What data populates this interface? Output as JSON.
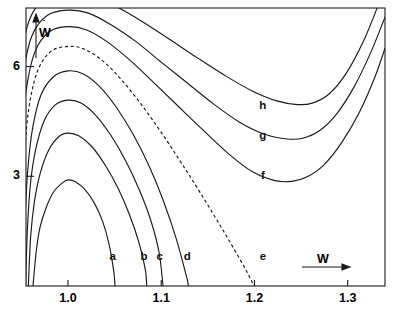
{
  "figure": {
    "background_color": "#ffffff",
    "ink_color": "#1a1a1a"
  },
  "axes": {
    "x_title": "W",
    "y_title": "W",
    "y_title_has_overdot": true,
    "y_title_dot": "˙",
    "x_ticks": [
      {
        "label": "1.0",
        "value": 1.0
      },
      {
        "label": "1.1",
        "value": 1.1
      },
      {
        "label": "1.2",
        "value": 1.2
      },
      {
        "label": "1.3",
        "value": 1.3
      }
    ],
    "y_ticks": [
      {
        "label": "3",
        "value": 3
      },
      {
        "label": "6",
        "value": 6
      }
    ],
    "x_range": [
      0.955,
      1.34
    ],
    "y_range": [
      0.0,
      7.6
    ],
    "grid": false
  },
  "curve_labels": {
    "a": "a",
    "b": "b",
    "c": "c",
    "d": "d",
    "e": "e",
    "f": "f",
    "g": "g",
    "h": "h"
  },
  "chart_data": {
    "type": "line",
    "title": "",
    "xlabel": "W",
    "ylabel": "W-dot",
    "xlim": [
      0.955,
      1.34
    ],
    "ylim": [
      0.0,
      7.6
    ],
    "grid": false,
    "legend": "inline-curve-labels",
    "xticks": [
      1.0,
      1.1,
      1.2,
      1.3
    ],
    "yticks": [
      3,
      6
    ],
    "series": [
      {
        "name": "a",
        "style": "solid",
        "label_position": {
          "x": 1.048,
          "y": 0.72
        },
        "points": [
          [
            0.9625,
            0.0
          ],
          [
            0.966,
            0.95
          ],
          [
            0.97,
            1.6
          ],
          [
            0.976,
            2.1
          ],
          [
            0.984,
            2.55
          ],
          [
            0.994,
            2.82
          ],
          [
            1.0,
            2.9
          ],
          [
            1.008,
            2.85
          ],
          [
            1.018,
            2.64
          ],
          [
            1.028,
            2.28
          ],
          [
            1.037,
            1.78
          ],
          [
            1.044,
            1.15
          ],
          [
            1.049,
            0.42
          ],
          [
            1.0505,
            0.0
          ]
        ]
      },
      {
        "name": "b",
        "style": "solid",
        "label_position": {
          "x": 1.0815,
          "y": 0.72
        },
        "points": [
          [
            0.9575,
            0.0
          ],
          [
            0.96,
            1.35
          ],
          [
            0.964,
            2.3
          ],
          [
            0.97,
            3.06
          ],
          [
            0.979,
            3.7
          ],
          [
            0.99,
            4.08
          ],
          [
            1.0,
            4.18
          ],
          [
            1.012,
            4.1
          ],
          [
            1.026,
            3.8
          ],
          [
            1.04,
            3.3
          ],
          [
            1.054,
            2.66
          ],
          [
            1.066,
            1.95
          ],
          [
            1.076,
            1.2
          ],
          [
            1.083,
            0.45
          ],
          [
            1.0845,
            0.0
          ]
        ]
      },
      {
        "name": "c",
        "style": "solid",
        "label_position": {
          "x": 1.0985,
          "y": 0.72
        },
        "points": [
          [
            0.9545,
            0.0
          ],
          [
            0.9565,
            1.55
          ],
          [
            0.96,
            2.85
          ],
          [
            0.9655,
            3.75
          ],
          [
            0.9745,
            4.52
          ],
          [
            0.9865,
            4.95
          ],
          [
            1.0,
            5.08
          ],
          [
            1.014,
            5.0
          ],
          [
            1.03,
            4.66
          ],
          [
            1.046,
            4.12
          ],
          [
            1.062,
            3.42
          ],
          [
            1.076,
            2.66
          ],
          [
            1.088,
            1.86
          ],
          [
            1.0975,
            0.95
          ],
          [
            1.102,
            0.0
          ]
        ]
      },
      {
        "name": "d",
        "style": "solid",
        "label_position": {
          "x": 1.128,
          "y": 0.72
        },
        "points": [
          [
            0.952,
            0.0
          ],
          [
            0.954,
            1.85
          ],
          [
            0.957,
            3.2
          ],
          [
            0.962,
            4.3
          ],
          [
            0.971,
            5.22
          ],
          [
            0.9845,
            5.72
          ],
          [
            1.0,
            5.88
          ],
          [
            1.016,
            5.8
          ],
          [
            1.034,
            5.45
          ],
          [
            1.052,
            4.88
          ],
          [
            1.07,
            4.14
          ],
          [
            1.087,
            3.28
          ],
          [
            1.102,
            2.35
          ],
          [
            1.116,
            1.3
          ],
          [
            1.1275,
            0.22
          ],
          [
            1.129,
            0.0
          ]
        ]
      },
      {
        "name": "e",
        "style": "dashed",
        "label_position": {
          "x": 1.209,
          "y": 0.72
        },
        "points": [
          [
            0.9495,
            0.0
          ],
          [
            0.951,
            2.15
          ],
          [
            0.9535,
            3.6
          ],
          [
            0.958,
            4.85
          ],
          [
            0.967,
            5.85
          ],
          [
            0.981,
            6.4
          ],
          [
            1.0,
            6.55
          ],
          [
            1.018,
            6.47
          ],
          [
            1.038,
            6.14
          ],
          [
            1.058,
            5.62
          ],
          [
            1.079,
            4.95
          ],
          [
            1.1,
            4.2
          ],
          [
            1.122,
            3.35
          ],
          [
            1.145,
            2.42
          ],
          [
            1.168,
            1.45
          ],
          [
            1.19,
            0.48
          ],
          [
            1.1995,
            0.0
          ]
        ]
      },
      {
        "name": "f",
        "style": "solid",
        "label_position": {
          "x": 1.209,
          "y": 2.92
        },
        "points": [
          [
            0.947,
            0.0
          ],
          [
            0.9485,
            2.5
          ],
          [
            0.951,
            4.15
          ],
          [
            0.9555,
            5.4
          ],
          [
            0.9645,
            6.4
          ],
          [
            0.98,
            6.95
          ],
          [
            1.0,
            7.09
          ],
          [
            1.02,
            7.0
          ],
          [
            1.043,
            6.66
          ],
          [
            1.067,
            6.16
          ],
          [
            1.092,
            5.56
          ],
          [
            1.118,
            4.92
          ],
          [
            1.145,
            4.26
          ],
          [
            1.172,
            3.62
          ],
          [
            1.198,
            3.12
          ],
          [
            1.222,
            2.88
          ],
          [
            1.24,
            2.86
          ],
          [
            1.256,
            2.98
          ],
          [
            1.274,
            3.3
          ],
          [
            1.293,
            3.9
          ],
          [
            1.312,
            4.72
          ],
          [
            1.329,
            5.7
          ],
          [
            1.34,
            6.5
          ]
        ]
      },
      {
        "name": "g",
        "style": "solid",
        "label_position": {
          "x": 1.209,
          "y": 4.02
        },
        "points": [
          [
            0.945,
            0.0
          ],
          [
            0.9462,
            2.8
          ],
          [
            0.9485,
            4.55
          ],
          [
            0.9525,
            5.85
          ],
          [
            0.9615,
            6.85
          ],
          [
            0.978,
            7.4
          ],
          [
            1.0,
            7.54
          ],
          [
            1.022,
            7.46
          ],
          [
            1.047,
            7.13
          ],
          [
            1.073,
            6.68
          ],
          [
            1.1,
            6.12
          ],
          [
            1.128,
            5.55
          ],
          [
            1.156,
            4.98
          ],
          [
            1.184,
            4.48
          ],
          [
            1.212,
            4.14
          ],
          [
            1.235,
            4.02
          ],
          [
            1.252,
            4.04
          ],
          [
            1.27,
            4.25
          ],
          [
            1.288,
            4.7
          ],
          [
            1.307,
            5.45
          ],
          [
            1.325,
            6.4
          ],
          [
            1.34,
            7.35
          ]
        ]
      },
      {
        "name": "h",
        "style": "solid",
        "label_position": {
          "x": 1.209,
          "y": 4.84
        },
        "points": [
          [
            0.9432,
            0.0
          ],
          [
            0.9444,
            3.05
          ],
          [
            0.9465,
            4.9
          ],
          [
            0.9505,
            6.3
          ],
          [
            0.959,
            7.3
          ],
          [
            0.976,
            7.88
          ],
          [
            1.0,
            8.02
          ],
          [
            1.025,
            7.95
          ],
          [
            1.051,
            7.65
          ],
          [
            1.079,
            7.24
          ],
          [
            1.108,
            6.76
          ],
          [
            1.138,
            6.25
          ],
          [
            1.168,
            5.76
          ],
          [
            1.197,
            5.34
          ],
          [
            1.224,
            5.06
          ],
          [
            1.246,
            4.96
          ],
          [
            1.262,
            5.0
          ],
          [
            1.28,
            5.25
          ],
          [
            1.298,
            5.8
          ],
          [
            1.317,
            6.7
          ],
          [
            1.333,
            7.7
          ],
          [
            1.34,
            8.2
          ]
        ]
      }
    ]
  }
}
